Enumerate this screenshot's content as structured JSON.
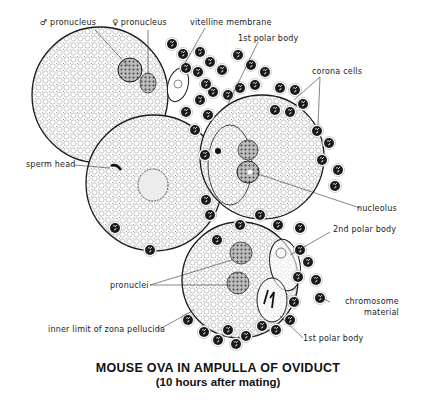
{
  "figure": {
    "title": "MOUSE OVA IN AMPULLA OF OVIDUCT",
    "subtitle": "(10 hours after mating)",
    "colors": {
      "ink": "#1a1a1a",
      "background": "#ffffff",
      "cytoplasm_stipple": "#9a9a9a"
    }
  },
  "labels": {
    "male_pronucleus": "♂ pronucleus",
    "female_pronucleus": "♀ pronucleus",
    "vitelline_membrane": "vitelline membrane",
    "first_polar_body_top": "1st polar body",
    "corona_cells": "corona cells",
    "sperm_head": "sperm head",
    "nucleolus": "nucleolus",
    "second_polar_body": "2nd polar body",
    "pronuclei": "pronuclei",
    "chromosome_material_line1": "chromosome",
    "chromosome_material_line2": "material",
    "inner_limit_zona": "inner limit of zona pellucida",
    "first_polar_body_bottom": "1st polar body"
  }
}
